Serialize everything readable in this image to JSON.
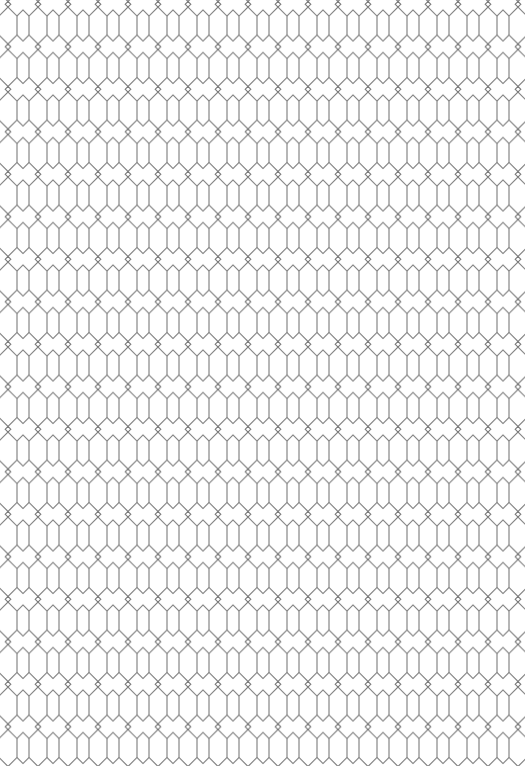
{
  "pattern": {
    "name": "hexagon-trellis",
    "tile_width": 30,
    "tile_height": 42.5,
    "offset_x": -7,
    "offset_y": 4,
    "line_color": "#7a7a7a",
    "background_color": "#ffffff",
    "line_width": 1.1
  }
}
